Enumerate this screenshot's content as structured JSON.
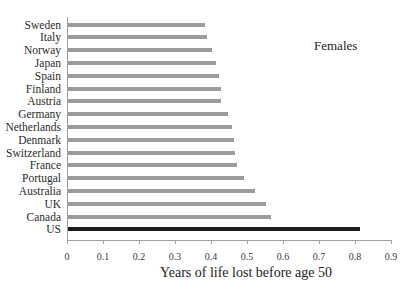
{
  "chart_data": {
    "type": "bar",
    "orientation": "horizontal",
    "title": "",
    "annotation": "Females",
    "xlabel": "Years of life lost before age 50",
    "ylabel": "",
    "xlim": [
      0,
      0.9
    ],
    "xticks": [
      "0",
      "0.1",
      "0.2",
      "0.3",
      "0.4",
      "0.5",
      "0.6",
      "0.7",
      "0.8",
      "0.9"
    ],
    "grid": false,
    "legend": null,
    "categories": [
      "Sweden",
      "Italy",
      "Norway",
      "Japan",
      "Spain",
      "Finland",
      "Austria",
      "Germany",
      "Netherlands",
      "Denmark",
      "Switzerland",
      "France",
      "Portugal",
      "Australia",
      "UK",
      "Canada",
      "US"
    ],
    "values": [
      0.38,
      0.385,
      0.4,
      0.41,
      0.42,
      0.425,
      0.425,
      0.445,
      0.455,
      0.46,
      0.465,
      0.47,
      0.49,
      0.52,
      0.55,
      0.565,
      0.81
    ],
    "highlighted": "US",
    "colors": {
      "default": "#9c9c9c",
      "highlight": "#1c1c1c"
    }
  }
}
